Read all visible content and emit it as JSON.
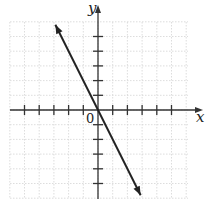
{
  "chart_data": {
    "type": "line",
    "title": "",
    "xlabel": "x",
    "ylabel": "y",
    "origin_label": "0",
    "xlim": [
      -6,
      6
    ],
    "ylim": [
      -6,
      6
    ],
    "grid": true,
    "tick_marks_x": [
      -5,
      -4,
      -3,
      -2,
      -1,
      1,
      2,
      3,
      4,
      5
    ],
    "tick_marks_y": [
      -5,
      -4,
      -3,
      -2,
      -1,
      1,
      2,
      3,
      4,
      5
    ],
    "series": [
      {
        "name": "line",
        "equation": "y = -2x",
        "x": [
          -2.9,
          0,
          2.9
        ],
        "y": [
          5.8,
          0,
          -5.8
        ],
        "arrows_both_ends": true
      }
    ],
    "legend": null
  },
  "labels": {
    "x_axis": "x",
    "y_axis": "y",
    "origin": "0"
  }
}
